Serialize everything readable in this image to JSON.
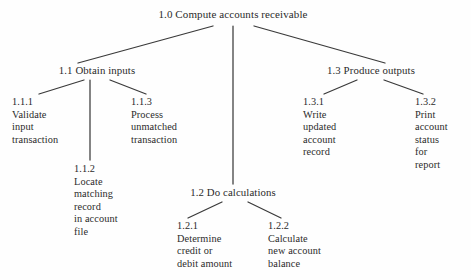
{
  "diagram": {
    "type": "hierarchy-tree",
    "line_color": "#3a3a3a",
    "text_color": "#2b2b2b",
    "background": "#fefefe",
    "nodes": {
      "root": {
        "id": "1.0",
        "label": "1.0 Compute accounts receivable",
        "x": 233,
        "y": 14
      },
      "obtain_inputs": {
        "id": "1.1",
        "label": "1.1 Obtain  inputs",
        "x": 97,
        "y": 70
      },
      "do_calculations": {
        "id": "1.2",
        "label": "1.2 Do calculations",
        "x": 233,
        "y": 192
      },
      "produce_outputs": {
        "id": "1.3",
        "label": "1.3 Produce  outputs",
        "x": 371,
        "y": 70
      },
      "validate_input": {
        "id": "1.1.1",
        "label": "1.1.1\nValidate\ninput\ntransaction",
        "x": 12,
        "y": 98
      },
      "locate_matching": {
        "id": "1.1.2",
        "label": "1.1.2\nLocate\nmatching\nrecord\nin account\nfile",
        "x": 74,
        "y": 165
      },
      "process_unmatched": {
        "id": "1.1.3",
        "label": "1.1.3\nProcess\nunmatched\ntransaction",
        "x": 131,
        "y": 98
      },
      "determine_credit": {
        "id": "1.2.1",
        "label": "1.2.1\nDetermine\ncredit or\ndebit amount",
        "x": 177,
        "y": 222
      },
      "calculate_balance": {
        "id": "1.2.2",
        "label": "1.2.2\nCalculate\nnew account\nbalance",
        "x": 268,
        "y": 222
      },
      "write_updated": {
        "id": "1.3.1",
        "label": "1.3.1\nWrite\nupdated\naccount\nrecord",
        "x": 303,
        "y": 98
      },
      "print_status": {
        "id": "1.3.2",
        "label": "1.3.2\nPrint\naccount\nstatus\nfor\nreport",
        "x": 415,
        "y": 98
      }
    },
    "edges": [
      {
        "from": "1.0",
        "to": "1.1",
        "x1": 213,
        "y1": 26,
        "x2": 78,
        "y2": 63
      },
      {
        "from": "1.0",
        "to": "1.2",
        "x1": 233,
        "y1": 26,
        "x2": 233,
        "y2": 184
      },
      {
        "from": "1.0",
        "to": "1.3",
        "x1": 254,
        "y1": 26,
        "x2": 385,
        "y2": 63
      },
      {
        "from": "1.1",
        "to": "1.1.1",
        "x1": 84,
        "y1": 80,
        "x2": 39,
        "y2": 94
      },
      {
        "from": "1.1",
        "to": "1.1.2",
        "x1": 90,
        "y1": 80,
        "x2": 90,
        "y2": 160
      },
      {
        "from": "1.1",
        "to": "1.1.3",
        "x1": 110,
        "y1": 80,
        "x2": 146,
        "y2": 94
      },
      {
        "from": "1.2",
        "to": "1.2.1",
        "x1": 222,
        "y1": 202,
        "x2": 188,
        "y2": 218
      },
      {
        "from": "1.2",
        "to": "1.2.2",
        "x1": 248,
        "y1": 202,
        "x2": 281,
        "y2": 218
      },
      {
        "from": "1.3",
        "to": "1.3.1",
        "x1": 357,
        "y1": 80,
        "x2": 324,
        "y2": 94
      },
      {
        "from": "1.3",
        "to": "1.3.2",
        "x1": 384,
        "y1": 80,
        "x2": 423,
        "y2": 94
      }
    ]
  }
}
